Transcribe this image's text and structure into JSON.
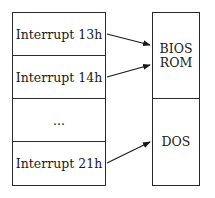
{
  "left_table": {
    "rows": [
      {
        "label": "Interrupt 13h"
      },
      {
        "label": "Interrupt 14h"
      },
      {
        "label": "..."
      },
      {
        "label": "Interrupt 21h"
      }
    ]
  },
  "right_table": {
    "blocks": [
      {
        "line1": "BIOS",
        "line2": "ROM"
      },
      {
        "line1": "DOS",
        "line2": ""
      }
    ]
  },
  "arrows": [
    {
      "from": "Interrupt 13h",
      "to": "BIOS ROM"
    },
    {
      "from": "Interrupt 14h",
      "to": "BIOS ROM"
    },
    {
      "from": "Interrupt 21h",
      "to": "DOS"
    }
  ]
}
